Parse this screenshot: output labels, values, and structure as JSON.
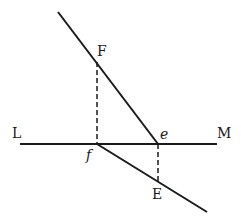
{
  "diagram": {
    "type": "geometric-construction",
    "line_color": "#1a1a1a",
    "background": "#ffffff",
    "labels": {
      "L": "L",
      "M": "M",
      "F": "F",
      "E": "E",
      "f": "f",
      "e": "e"
    },
    "points": {
      "line_top_end": [
        58,
        12
      ],
      "F": [
        97,
        62
      ],
      "e": [
        158,
        144
      ],
      "f": [
        97,
        144
      ],
      "E": [
        158,
        182
      ],
      "line_bottom_end": [
        207,
        212
      ],
      "L_end": [
        20,
        144
      ],
      "M_end": [
        217,
        144
      ]
    },
    "segments": [
      {
        "name": "horizontal-line-LM",
        "from": "L_end",
        "to": "M_end",
        "style": "solid"
      },
      {
        "name": "incident-line-to-e",
        "from": "line_top_end",
        "to": "e",
        "style": "solid"
      },
      {
        "name": "refracted-line-from-f",
        "from": "f",
        "to": "line_bottom_end",
        "style": "solid"
      },
      {
        "name": "perpendicular-F-f",
        "from": "F",
        "to": "f",
        "style": "dashed"
      },
      {
        "name": "perpendicular-e-E",
        "from": "e",
        "to": "E",
        "style": "dashed"
      }
    ]
  }
}
